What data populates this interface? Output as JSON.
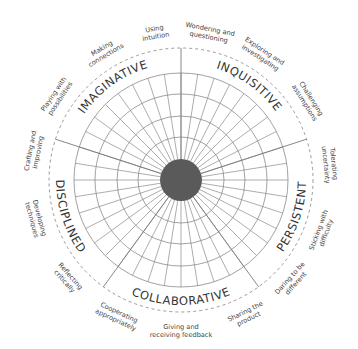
{
  "diagram": {
    "geometry": {
      "cx": 181,
      "cy": 180,
      "hub_radius": 21,
      "ring_radii": [
        43,
        64,
        86,
        107
      ],
      "dashed_radius": 132,
      "spoke_count": 40,
      "divider_bearings": [
        0,
        72,
        144,
        216,
        288
      ],
      "category_label_radius": 117,
      "sub_label_radius": 150
    },
    "colors": {
      "hub": "#5a5a5a",
      "grid": "#8a8a8a",
      "text": "#333333"
    },
    "categories": [
      {
        "label": "INQUISITIVE",
        "bearing": 36
      },
      {
        "label": "PERSISTENT",
        "bearing": 108
      },
      {
        "label": "COLLABORATIVE",
        "bearing": 180
      },
      {
        "label": "DISCIPLINED",
        "bearing": 252
      },
      {
        "label": "IMAGINATIVE",
        "bearing": 324
      }
    ],
    "habits": [
      {
        "lines": [
          "Wondering and",
          "questioning"
        ],
        "bearing": 11,
        "category": "INQUISITIVE"
      },
      {
        "lines": [
          "Exploring and",
          "investigating"
        ],
        "bearing": 33,
        "category": "INQUISITIVE"
      },
      {
        "lines": [
          "Challenging",
          "assumptions"
        ],
        "bearing": 58,
        "category": "INQUISITIVE"
      },
      {
        "lines": [
          "Tolerating",
          "uncertainty"
        ],
        "bearing": 84,
        "category": "PERSISTENT"
      },
      {
        "lines": [
          "Sticking with",
          "difficulty"
        ],
        "bearing": 110,
        "category": "PERSISTENT"
      },
      {
        "lines": [
          "Daring to be",
          "different"
        ],
        "bearing": 132,
        "category": "PERSISTENT"
      },
      {
        "lines": [
          "Sharing the",
          "product"
        ],
        "bearing": 154,
        "category": "COLLABORATIVE"
      },
      {
        "lines": [
          "Giving and",
          "receiving feedback"
        ],
        "bearing": 180,
        "category": "COLLABORATIVE"
      },
      {
        "lines": [
          "Cooperating",
          "appropriately"
        ],
        "bearing": 205,
        "category": "COLLABORATIVE"
      },
      {
        "lines": [
          "Reflecting",
          "critically"
        ],
        "bearing": 229,
        "category": "DISCIPLINED"
      },
      {
        "lines": [
          "Developing",
          "techniques"
        ],
        "bearing": 255,
        "category": "DISCIPLINED"
      },
      {
        "lines": [
          "Crafting and",
          "improving"
        ],
        "bearing": 281,
        "category": "DISCIPLINED"
      },
      {
        "lines": [
          "Playing with",
          "possibilities"
        ],
        "bearing": 304,
        "category": "IMAGINATIVE"
      },
      {
        "lines": [
          "Making",
          "connections"
        ],
        "bearing": 329,
        "category": "IMAGINATIVE"
      },
      {
        "lines": [
          "Using",
          "intuition"
        ],
        "bearing": 350,
        "category": "IMAGINATIVE"
      }
    ]
  }
}
